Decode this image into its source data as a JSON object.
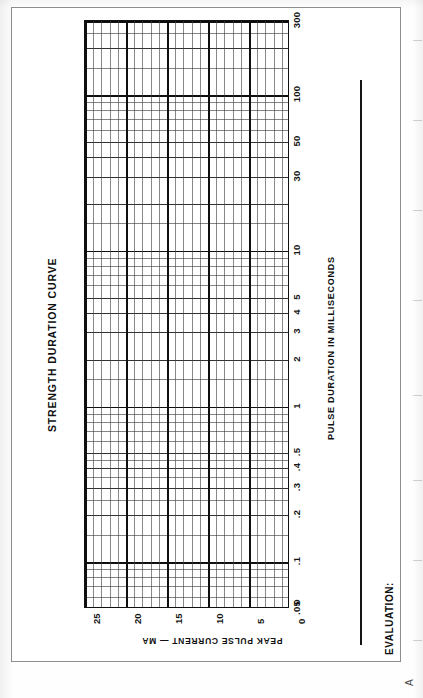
{
  "document": {
    "figure_marker": "A"
  },
  "chart": {
    "title": "STRENGTH DURATION CURVE",
    "x_axis_title": "PULSE DURATION IN MILLISECONDS",
    "y_axis_title": "PEAK PULSE CURRENT — MA",
    "origin_label": "0"
  },
  "form": {
    "evaluation_label": "EVALUATION:"
  },
  "chart_data": {
    "type": "line",
    "title": "STRENGTH DURATION CURVE",
    "subtitle": "",
    "xlabel": "PULSE DURATION IN MILLISECONDS",
    "ylabel": "PEAK PULSE CURRENT — MA",
    "xscale": "log",
    "yscale": "linear",
    "xlim": [
      0.05,
      300
    ],
    "ylim": [
      0,
      25
    ],
    "grid": true,
    "legend_position": "none",
    "annotations": [
      "EVALUATION:"
    ],
    "note": "Blank clinical worksheet: semi-logarithmic grid with no plotted data points.",
    "x_tick_labels": [
      ".05",
      ".1",
      ".2",
      ".3",
      ".4",
      ".5",
      "1",
      "2",
      "3",
      "4",
      "5",
      "10",
      "30",
      "50",
      "100",
      "300"
    ],
    "x_tick_values": [
      0.05,
      0.1,
      0.2,
      0.3,
      0.4,
      0.5,
      1,
      2,
      3,
      4,
      5,
      10,
      30,
      50,
      100,
      300
    ],
    "y_tick_labels": [
      "0",
      "5",
      "10",
      "15",
      "20",
      "25"
    ],
    "y_tick_values": [
      0,
      5,
      10,
      15,
      20,
      25
    ],
    "series": [
      {
        "name": "measured curve",
        "x": [],
        "values": []
      }
    ]
  },
  "grid_spec": {
    "x_major": [
      0.05,
      0.1,
      1,
      10,
      100,
      300
    ],
    "x_mid": [
      0.2,
      0.3,
      0.4,
      0.5,
      2,
      3,
      4,
      5,
      20,
      30,
      40,
      50,
      200
    ],
    "y_major": [
      0,
      5,
      10,
      15,
      20,
      25
    ],
    "y_minor_step": 1
  }
}
